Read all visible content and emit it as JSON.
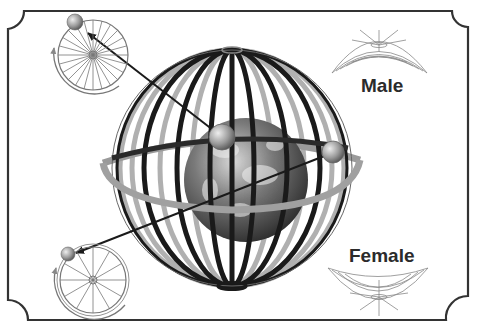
{
  "diagram": {
    "labels": {
      "male": "Male",
      "female": "Female"
    },
    "elements": {
      "frame": "decorative-border-with-concave-corners",
      "center": "earth-globe-inside-wire-cage",
      "equator_ring": "horizontal-ring-around-globe",
      "planet_top": "small-sphere-on-cage-front",
      "planet_right": "small-sphere-on-cage-right",
      "wheel_top_left": "spoked-wheel-with-rotation-arrow (24 spokes)",
      "wheel_bottom_left": "spoked-wheel-with-rotation-arrow (12 spokes)",
      "male_symbol": "dome-shaped-wire-surface (convex up)",
      "female_symbol": "bowl-shaped-wire-surface (concave up)"
    },
    "colors": {
      "frame": "#333333",
      "cage_dark": "#1a1a1a",
      "cage_light": "#a8a8a8",
      "line_art": "#777777",
      "text": "#2b2b2b"
    }
  }
}
